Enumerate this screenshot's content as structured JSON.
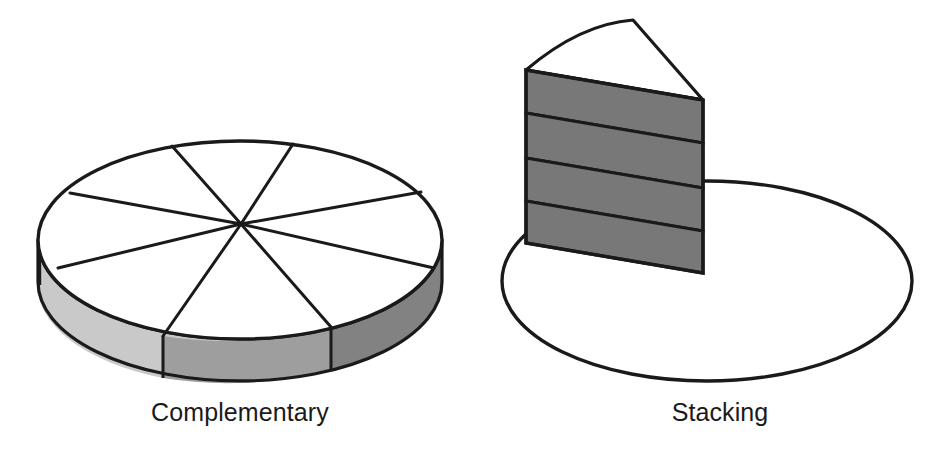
{
  "page": {
    "background_color": "#ffffff",
    "width": 936,
    "height": 459,
    "kind": "illustration-two-3d-pie-diagrams"
  },
  "figures": [
    {
      "id": "complementary",
      "label": "Complementary",
      "description": "3D pie cylinder divided into 8 equal wedges, white top face, shaded side wall",
      "slice_count": 8,
      "top_face_color": "#ffffff",
      "outline_color": "#1a1a1a",
      "wall_colors": [
        "#c9c9c9",
        "#9e9e9e",
        "#828282"
      ],
      "geometry": {
        "center_x": 240,
        "center_y": 240,
        "radius_x": 202,
        "radius_y": 99,
        "depth": 42,
        "hub_x": 241,
        "hub_y": 224
      }
    },
    {
      "id": "stacking",
      "label": "Stacking",
      "description": "Single tall pie wedge standing on an empty ellipse base, divided into 4 stacked dark bands",
      "band_count": 4,
      "band_color": "#787878",
      "top_face_color": "#ffffff",
      "outline_color": "#1a1a1a",
      "base_ellipse_fill": "#ffffff",
      "geometry": {
        "ellipse_center_x": 707,
        "ellipse_center_y": 281,
        "ellipse_radius_x": 205,
        "ellipse_radius_y": 100,
        "wedge_apex_x": 633,
        "wedge_apex_y": 20,
        "wedge_left_x": 526,
        "wedge_left_top_y": 70,
        "wedge_right_x": 703,
        "wedge_right_top_y": 100,
        "wedge_left_bottom_y": 243,
        "wedge_right_bottom_y": 273
      }
    }
  ],
  "labels": {
    "left": "Complementary",
    "right": "Stacking"
  },
  "colors": {
    "stroke": "#1a1a1a",
    "wall_light": "#c9c9c9",
    "wall_mid": "#9e9e9e",
    "wall_dark": "#828282",
    "band": "#787878",
    "white": "#ffffff",
    "text": "#1a1a1a"
  }
}
